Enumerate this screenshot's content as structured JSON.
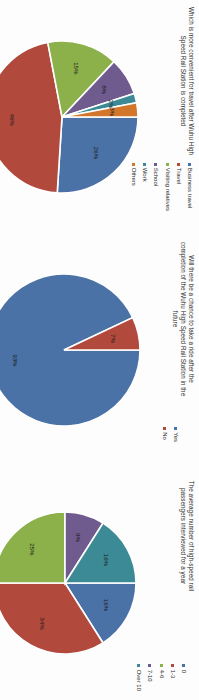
{
  "page": {
    "orientation": "rotated-90",
    "background": "#ffffff"
  },
  "palette": {
    "blue": "#4472a8",
    "red": "#b0483c",
    "green": "#8eb martinez",
    "green_fix": "#8fb council",
    "series_blue": "#4a72a6",
    "series_red": "#b1493d",
    "series_green": "#8cb04a",
    "series_purple": "#6f5b8e",
    "series_teal": "#3c8a96",
    "series_orange": "#d2762c"
  },
  "charts": [
    {
      "id": "purpose-of-travel",
      "title": "Which is more convenient for travel after Wuhu High Speed Rail Station is completed",
      "legend_position": "right",
      "legend": [
        {
          "label": "Business travel",
          "color": "#4a72a6"
        },
        {
          "label": "Travel",
          "color": "#b1493d"
        },
        {
          "label": "Visiting relatives",
          "color": "#8cb04a"
        },
        {
          "label": "School",
          "color": "#6f5b8e"
        },
        {
          "label": "Work",
          "color": "#3c8a96"
        },
        {
          "label": "Others",
          "color": "#d2762c"
        }
      ],
      "chart_data": {
        "type": "pie",
        "title": "Which is more convenient for travel after Wuhu High Speed Rail Station is completed",
        "categories": [
          "Business travel",
          "Travel",
          "Visiting relatives",
          "School",
          "Work",
          "Others"
        ],
        "values": [
          26,
          46,
          15,
          8,
          2,
          3
        ],
        "labels": [
          "26%",
          "46%",
          "15%",
          "8%",
          "2%",
          "3%"
        ],
        "colors": [
          "#4a72a6",
          "#b1493d",
          "#8cb04a",
          "#6f5b8e",
          "#3c8a96",
          "#d2762c"
        ],
        "legend_position": "right",
        "grid": false
      }
    },
    {
      "id": "chance-to-take-ride",
      "title": "Will there be a chance to take a ride after the completion of the Wuhu High Speed Rail Station in the future",
      "legend_position": "right",
      "legend": [
        {
          "label": "Yes",
          "color": "#4a72a6"
        },
        {
          "label": "No",
          "color": "#b1493d"
        }
      ],
      "chart_data": {
        "type": "pie",
        "title": "Will there be a chance to take a ride after the completion of the Wuhu High Speed Rail Station in the future",
        "categories": [
          "Yes",
          "No"
        ],
        "values": [
          93,
          7
        ],
        "labels": [
          "93%",
          "7%"
        ],
        "colors": [
          "#4a72a6",
          "#b1493d"
        ],
        "legend_position": "right",
        "grid": false
      }
    },
    {
      "id": "average-rides-per-year",
      "title": "The average number of high-speed rail passengers interviewed for a year",
      "legend_position": "right",
      "legend": [
        {
          "label": "0",
          "color": "#4a72a6"
        },
        {
          "label": "1-3",
          "color": "#b1493d"
        },
        {
          "label": "4-6",
          "color": "#8cb04a"
        },
        {
          "label": "7-10",
          "color": "#6f5b8e"
        },
        {
          "label": "Over 10",
          "color": "#3c8a96"
        }
      ],
      "chart_data": {
        "type": "pie",
        "title": "The average number of high-speed rail passengers interviewed for a year",
        "categories": [
          "0",
          "1-3",
          "4-6",
          "7-10",
          "Over 10"
        ],
        "values": [
          16,
          34,
          25,
          9,
          16
        ],
        "labels": [
          "16%",
          "34%",
          "25%",
          "9%",
          "16%"
        ],
        "colors": [
          "#4a72a6",
          "#b1493d",
          "#8cb04a",
          "#6f5b8e",
          "#3c8a96"
        ],
        "legend_position": "right",
        "grid": false
      }
    }
  ]
}
